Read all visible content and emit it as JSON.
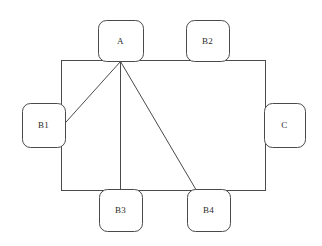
{
  "diagram": {
    "type": "node-link-schematic",
    "stroke_color": "#4a4a4a",
    "background_color": "#ffffff",
    "stroke_width": 1,
    "table": {
      "name": "central-rectangle",
      "x": 61,
      "y": 60,
      "width": 204,
      "height": 130
    },
    "nodes": [
      {
        "id": "A",
        "label": "A",
        "x": 98,
        "y": 20,
        "width": 45,
        "height": 41,
        "side": "top"
      },
      {
        "id": "B2",
        "label": "B2",
        "x": 186,
        "y": 20,
        "width": 43,
        "height": 41,
        "side": "top"
      },
      {
        "id": "B1",
        "label": "B1",
        "x": 22,
        "y": 103,
        "width": 43,
        "height": 44,
        "side": "left"
      },
      {
        "id": "C",
        "label": "C",
        "x": 264,
        "y": 103,
        "width": 41,
        "height": 44,
        "side": "right"
      },
      {
        "id": "B3",
        "label": "B3",
        "x": 99,
        "y": 189,
        "width": 43,
        "height": 42,
        "side": "bottom"
      },
      {
        "id": "B4",
        "label": "B4",
        "x": 187,
        "y": 189,
        "width": 43,
        "height": 42,
        "side": "bottom"
      }
    ],
    "connectors": [
      {
        "id": "A-to-B1",
        "from": "A",
        "to": "B1",
        "x1": 120,
        "y1": 61,
        "x2": 57,
        "y2": 131
      },
      {
        "id": "A-to-B3",
        "from": "A",
        "to": "B3",
        "x1": 120,
        "y1": 61,
        "x2": 120,
        "y2": 190
      },
      {
        "id": "A-to-B4",
        "from": "A",
        "to": "B4",
        "x1": 120,
        "y1": 61,
        "x2": 196,
        "y2": 190
      }
    ]
  }
}
